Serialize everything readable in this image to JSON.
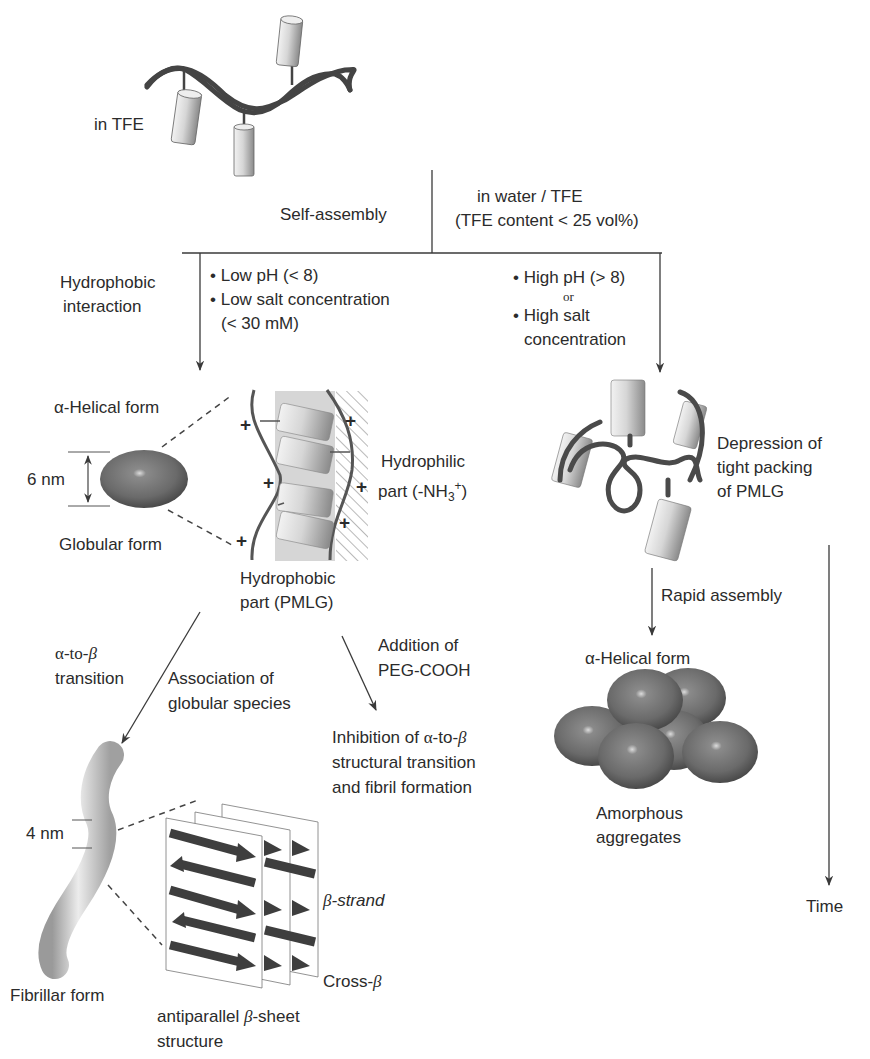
{
  "diagram": {
    "type": "flowchart",
    "start": {
      "label": "in TFE"
    },
    "branch": {
      "left_condition_label": "Self-assembly",
      "right_condition_line1": "in water / TFE",
      "right_condition_line2": "(TFE content < 25 vol%)"
    },
    "left_path": {
      "mechanism_line1": "Hydrophobic",
      "mechanism_line2": "interaction",
      "conditions": [
        "• Low pH (< 8)",
        "• Low salt concentration",
        "(< 30 mM)"
      ],
      "alpha_helical_label": "α-Helical form",
      "size_label": "6 nm",
      "globular_label": "Globular form",
      "hydrophilic_line1": "Hydrophilic",
      "hydrophilic_line2_prefix": "part (-NH",
      "hydrophilic_sub": "3",
      "hydrophilic_sup": "+",
      "hydrophilic_suffix": ")",
      "hydrophobic_line1": "Hydrophobic",
      "hydrophobic_line2": "part (PMLG)",
      "charge_symbol": "+",
      "transition_line1_a": "α-to-",
      "transition_line1_b": "β",
      "transition_line2": "transition",
      "association_line1": "Association of",
      "association_line2": "globular species",
      "addition_line1": "Addition of",
      "addition_line2": "PEG-COOH",
      "inhibition_line1_a": "Inhibition of ",
      "inhibition_line1_b": "α",
      "inhibition_line1_c": "-to-",
      "inhibition_line1_d": "β",
      "inhibition_line2": "structural transition",
      "inhibition_line3": "and fibril formation",
      "fibril_size_label": "4 nm",
      "fibrillar_label": "Fibrillar form",
      "beta_strand_a": "β",
      "beta_strand_b": "-strand",
      "cross_beta_a": "Cross-",
      "cross_beta_b": "β",
      "sheet_line1_a": "antiparallel ",
      "sheet_line1_b": "β",
      "sheet_line1_c": "-sheet",
      "sheet_line2": "structure"
    },
    "right_path": {
      "conditions": [
        "• High pH (> 8)",
        "or",
        "• High salt",
        "concentration"
      ],
      "depression_line1": "Depression of",
      "depression_line2": "tight packing",
      "depression_line3": "of PMLG",
      "rapid_label": "Rapid assembly",
      "alpha_helical_label": "α-Helical form",
      "amorphous_line1": "Amorphous",
      "amorphous_line2": "aggregates"
    },
    "time_axis": {
      "label": "Time"
    },
    "colors": {
      "line": "#3a3a3a",
      "sphere": "#6b6b6b",
      "cylinder": "#c8c8c8",
      "backbone": "#454545",
      "hydrophobic_band": "#d4d4d4"
    }
  }
}
